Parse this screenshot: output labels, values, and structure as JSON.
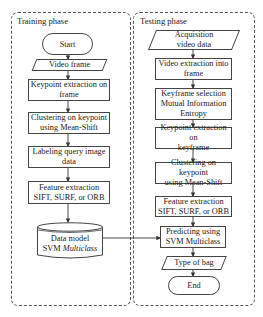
{
  "training": {
    "title": "Training phase",
    "start": "Start",
    "video_frame": "Video frame",
    "keypoint": [
      "Keypoint extraction on",
      "frame"
    ],
    "clustering": [
      "Clustering on keypoint",
      "using Mean-Shift"
    ],
    "labeling": [
      "Labeling query image",
      "data"
    ],
    "feature": [
      "Feature extraction",
      "SIFT, SURF, or ORB"
    ],
    "datamodel": [
      "Data model",
      "SVM",
      "Multiclass"
    ]
  },
  "testing": {
    "title": "Testing phase",
    "acquisition": [
      "Acquisition",
      "video data"
    ],
    "video_extraction": [
      "Video extraction into",
      "frame"
    ],
    "keyframe": [
      "Keyframe selection",
      "Mutual Information",
      "Entropy"
    ],
    "keypoint": [
      "Keypoint extraction on",
      "keyframe"
    ],
    "clustering": [
      "Clustering on keypoint",
      "using Mean-Shift"
    ],
    "feature": [
      "Feature extraction",
      "SIFT, SURF, or ORB"
    ],
    "predicting": [
      "Predicting using",
      "SVM Multiclass"
    ],
    "type_of_bag": "Type of bag",
    "end": "End"
  }
}
